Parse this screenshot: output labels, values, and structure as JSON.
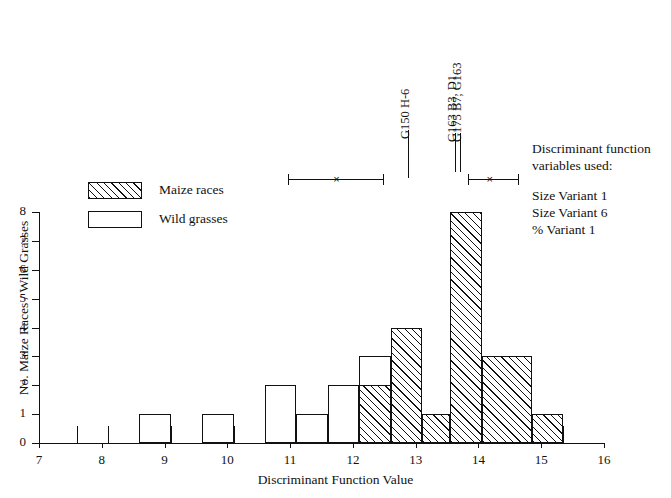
{
  "chart_data": {
    "type": "bar",
    "title": "",
    "xlabel": "Discriminant Function Value",
    "ylabel": "No. Maize Races / Wild Grasses",
    "xlim": [
      7,
      16
    ],
    "ylim": [
      0,
      8
    ],
    "bin_width": 0.5,
    "grid": false,
    "x_ticks": [
      7,
      8,
      9,
      10,
      11,
      12,
      13,
      14,
      15,
      16
    ],
    "x_tick_labels": [
      "7",
      "8",
      "9",
      "10",
      "11",
      "12",
      "13",
      "14",
      "15",
      "16"
    ],
    "x_minor_ticks": [
      7.6,
      8.1,
      8.6,
      9.1,
      9.6,
      10.1,
      10.6,
      11.1,
      11.6,
      12.1,
      12.6,
      13.1,
      13.55,
      14.05,
      14.85,
      15.35
    ],
    "y_ticks": [
      0,
      1,
      2,
      3,
      4,
      5,
      6,
      7,
      8
    ],
    "y_tick_labels": [
      "0",
      "1",
      "2",
      "3",
      "4",
      "5",
      "6",
      "7",
      "8"
    ],
    "series": [
      {
        "name": "Wild grasses",
        "style": "outline",
        "bins": [
          {
            "x0": 8.6,
            "x1": 9.1,
            "value": 1
          },
          {
            "x0": 9.6,
            "x1": 10.1,
            "value": 1
          },
          {
            "x0": 10.6,
            "x1": 11.1,
            "value": 2
          },
          {
            "x0": 11.1,
            "x1": 11.6,
            "value": 1
          },
          {
            "x0": 11.6,
            "x1": 12.1,
            "value": 2
          },
          {
            "x0": 12.1,
            "x1": 12.6,
            "value": 3
          },
          {
            "x0": 12.6,
            "x1": 13.1,
            "value": 4
          }
        ]
      },
      {
        "name": "Maize races",
        "style": "hatched",
        "bins": [
          {
            "x0": 12.1,
            "x1": 12.6,
            "value": 2
          },
          {
            "x0": 12.6,
            "x1": 13.1,
            "value": 4
          },
          {
            "x0": 13.1,
            "x1": 13.55,
            "value": 1
          },
          {
            "x0": 13.55,
            "x1": 14.05,
            "value": 8
          },
          {
            "x0": 14.05,
            "x1": 14.85,
            "value": 3
          },
          {
            "x0": 14.85,
            "x1": 15.35,
            "value": 1
          }
        ]
      }
    ],
    "markers": [
      {
        "label": "G150 H-6",
        "x": 12.87
      },
      {
        "label": "G163 B3, D1",
        "x": 13.63
      },
      {
        "label": "G175 B7, G163",
        "x": 13.7
      }
    ],
    "error_bars": [
      {
        "center": 11.74,
        "low": 10.97,
        "high": 12.48,
        "marker": "×"
      },
      {
        "center": 14.18,
        "low": 13.83,
        "high": 14.63,
        "marker": "×"
      }
    ]
  },
  "legend": {
    "position": "upper-left",
    "items": [
      {
        "label": "Maize races",
        "style": "hatched"
      },
      {
        "label": "Wild grasses",
        "style": "outline"
      }
    ]
  },
  "note": {
    "heading_line1": "Discriminant function",
    "heading_line2": "variables used:",
    "variables": [
      "Size Variant 1",
      "Size Variant 6",
      "% Variant 1"
    ]
  },
  "colors": {
    "ink": "#111111",
    "background": "#ffffff"
  }
}
